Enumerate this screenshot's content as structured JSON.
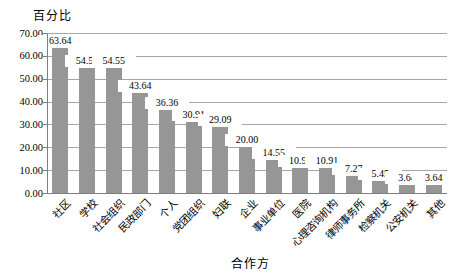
{
  "chart_data": {
    "type": "bar",
    "title": "",
    "ylabel": "百分比",
    "xlabel": "合作方",
    "ylim": [
      0,
      70
    ],
    "ytick_step": 10,
    "yticks": [
      "70.00",
      "60.00",
      "50.00",
      "40.00",
      "30.00",
      "20.00",
      "10.00",
      "0.00"
    ],
    "categories": [
      "社区",
      "学校",
      "社会组织",
      "民政部门",
      "个人",
      "党团组织",
      "妇联",
      "企业",
      "事业单位",
      "医院",
      "心理咨询机构",
      "律师事务所",
      "检察机关",
      "公安机关",
      "其他"
    ],
    "values": [
      63.64,
      54.55,
      54.55,
      43.64,
      36.36,
      30.91,
      29.09,
      20.0,
      14.55,
      10.91,
      10.91,
      7.27,
      5.45,
      3.64,
      3.64
    ],
    "value_labels": [
      "63.64",
      "54.55",
      "54.55",
      "43.64",
      "36.36",
      "30.91",
      "29.09",
      "20.00",
      "14.55",
      "10.91",
      "10.91",
      "7.27",
      "5.45",
      "3.64",
      "3.64"
    ],
    "legend": false,
    "grid": true,
    "colors": {
      "bar": "#969696",
      "gridline": "#a6a6a6",
      "axis": "#7f7f7f",
      "text": "#000000",
      "background": "#ffffff"
    }
  }
}
